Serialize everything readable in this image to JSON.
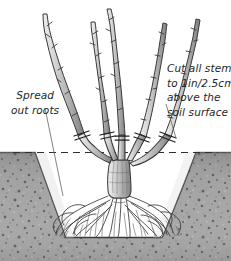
{
  "illustration": {
    "title": "Planting a bare-root shrub in a prepared hole",
    "width": 231,
    "height": 261,
    "style": "pen-and-ink botanical line drawing with stippled soil"
  },
  "annotations": {
    "left": {
      "name": "spread-out-roots-label",
      "lines": [
        "Spread",
        "out roots"
      ],
      "leader": "thin line from label down-right to the root zone"
    },
    "right": {
      "name": "cut-all-stems-label",
      "lines": [
        "Cut all stems",
        "to 1in/2.5cm",
        "above the",
        "soil surface"
      ],
      "leader": "thin line from label left to the outer right stem cut mark"
    }
  },
  "elements": {
    "soil_surface_line": "dashed horizontal line marking the soil surface",
    "planting_hole": "white tapered pit excavated in the soil",
    "shrub": "bare-root shrub with five upright stems above a short trunk",
    "stem_count": 5,
    "cut_marks": "short paired strokes across each stem just above the soil line",
    "roots": "fan of fibrous roots spread across the base of the hole"
  },
  "colors": {
    "background": "#ffffff",
    "soil_base": "#9b9b9b",
    "soil_dark": "#5d5d5d",
    "soil_light": "#b9b9b9",
    "ink": "#2b2b2b",
    "stem_fill": "#c9c9c9",
    "stem_shade": "#8e8e8e",
    "text": "#262626"
  }
}
